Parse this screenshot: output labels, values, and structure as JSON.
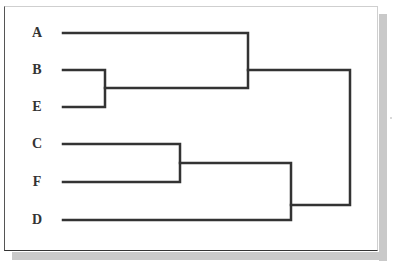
{
  "diagram": {
    "type": "dendrogram",
    "orientation": "horizontal (leaves left, root right)",
    "line_color": "#333333",
    "leaves": [
      {
        "label": "A",
        "y": 33
      },
      {
        "label": "B",
        "y": 70
      },
      {
        "label": "E",
        "y": 107
      },
      {
        "label": "C",
        "y": 144
      },
      {
        "label": "F",
        "y": 182
      },
      {
        "label": "D",
        "y": 220
      }
    ],
    "merges": [
      {
        "children": [
          "B",
          "E"
        ],
        "order": 1
      },
      {
        "children": [
          "C",
          "F"
        ],
        "order": 2
      },
      {
        "children": [
          "A",
          "(B,E)"
        ],
        "order": 3
      },
      {
        "children": [
          "(C,F)",
          "D"
        ],
        "order": 4
      },
      {
        "children": [
          "(A,(B,E))",
          "((C,F),D)"
        ],
        "order": 5
      }
    ]
  }
}
